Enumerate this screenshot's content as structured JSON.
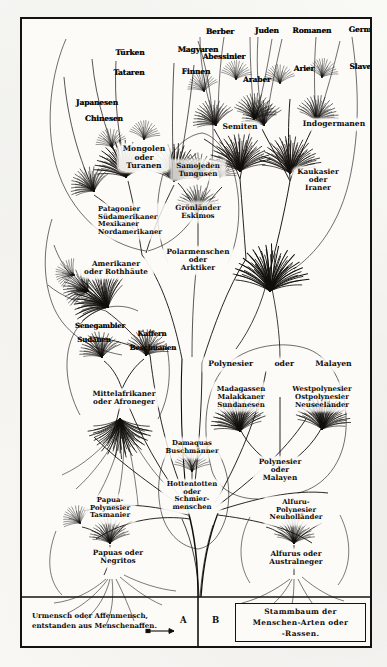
{
  "figure": {
    "title": "Stammbaum der Menschen-Arten oder -Rassen.",
    "title_line1": "Stammbaum der",
    "title_line2": "Menschen-Arten oder",
    "title_line3": "-Rassen.",
    "caption_line1": "Urmensch oder Affenmensch,",
    "caption_line2": "entstanden aus Menschenaffen.",
    "marker_a": "A",
    "marker_b": "B",
    "ink_color": "#100e0b",
    "paper_color": "#fcfbf8"
  },
  "branches": {
    "mongolian": {
      "tips": [
        "Türken",
        "Magyaren",
        "Tataren",
        "Finnen",
        "Japanesen",
        "Chinesen"
      ],
      "node_line1": "Mongolen",
      "node_line2": "oder",
      "node_line3": "Turanen"
    },
    "american": {
      "tips": [
        "Patagonier",
        "Südamerikaner",
        "Mexikaner",
        "Nordamerikaner"
      ],
      "node_line1": "Amerikaner",
      "node_line2": "oder Rothhäute"
    },
    "arctic": {
      "tips": [
        "Samojeden",
        "Tungusen",
        "Grönländer",
        "Eskimos"
      ],
      "node_line1": "Polarmenschen",
      "node_line2": "oder",
      "node_line3": "Arktiker"
    },
    "semitic": {
      "tips": [
        "Berber",
        "Juden",
        "Abessinier",
        "Araber"
      ],
      "node_line1": "Semiten"
    },
    "indogermanic": {
      "tips": [
        "Romanen",
        "Germanen",
        "Arier",
        "Slaven"
      ],
      "node_line1": "Indogermanen"
    },
    "caucasian": {
      "node_line1": "Kaukasier",
      "node_line2": "oder",
      "node_line3": "Iraner"
    },
    "african": {
      "tips": [
        "Senegambier",
        "Sudanen",
        "Kaffern",
        "Beschuanen"
      ],
      "node_line1": "Mittelafrikaner",
      "node_line2": "oder Afroneger"
    },
    "hottentot": {
      "tips": [
        "Damaquas",
        "Buschmänner"
      ],
      "node_line1": "Hottentotten",
      "node_line2": "oder",
      "node_line3": "Schmier-",
      "node_line4": "menschen"
    },
    "papuan": {
      "tips": [
        "Papua-",
        "Polynesier",
        "Tasmanier"
      ],
      "node_line1": "Papuas oder",
      "node_line2": "Negritos"
    },
    "malay": {
      "header_left": "Polynesier",
      "header_mid": "oder",
      "header_right": "Malayen",
      "tips_left": [
        "Madagassen",
        "Malakkaner",
        "Sundanesen"
      ],
      "tips_right": [
        "Westpolynesier",
        "Ostpolynesier",
        "Neuseeländer"
      ],
      "node_line1": "Polynesier",
      "node_line2": "oder",
      "node_line3": "Malayen"
    },
    "australian": {
      "tips": [
        "Alfuru-",
        "Polynesier",
        "Neuholländer"
      ],
      "node_line1": "Alfurus oder",
      "node_line2": "Australneger"
    }
  }
}
